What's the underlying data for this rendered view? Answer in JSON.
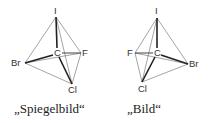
{
  "figure": {
    "left": {
      "caption": "„Spiegelbild“",
      "atoms": {
        "top": "I",
        "center": "C",
        "left": "Br",
        "right": "F",
        "bottom": "Cl"
      }
    },
    "right": {
      "caption": "„Bild“",
      "atoms": {
        "top": "I",
        "center": "C",
        "left": "F",
        "right": "Br",
        "bottom": "Cl"
      }
    }
  },
  "colors": {
    "line": "#222222",
    "thin_line": "#666666",
    "text": "#333333"
  }
}
